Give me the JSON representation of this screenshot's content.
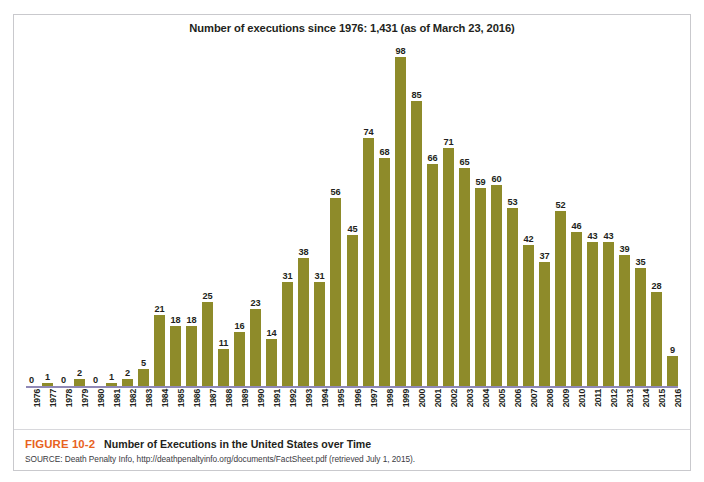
{
  "chart_data": {
    "type": "bar",
    "title": "Number of executions since 1976: 1,431 (as of March 23, 2016)",
    "xlabel": "",
    "ylabel": "",
    "ylim": [
      0,
      98
    ],
    "grid": false,
    "legend": "none",
    "bar_color": "#8E8B2A",
    "axis_color": "#8F88B6",
    "categories": [
      "1976",
      "1977",
      "1978",
      "1979",
      "1980",
      "1981",
      "1982",
      "1983",
      "1984",
      "1985",
      "1986",
      "1987",
      "1988",
      "1989",
      "1990",
      "1991",
      "1992",
      "1993",
      "1994",
      "1995",
      "1996",
      "1997",
      "1998",
      "1999",
      "2000",
      "2001",
      "2002",
      "2003",
      "2004",
      "2005",
      "2006",
      "2007",
      "2008",
      "2009",
      "2010",
      "2011",
      "2012",
      "2013",
      "2014",
      "2015",
      "2016"
    ],
    "values": [
      0,
      1,
      0,
      2,
      0,
      1,
      2,
      5,
      21,
      18,
      18,
      25,
      11,
      16,
      23,
      14,
      31,
      38,
      31,
      56,
      45,
      74,
      68,
      98,
      85,
      66,
      71,
      65,
      59,
      60,
      53,
      42,
      37,
      52,
      46,
      43,
      43,
      39,
      35,
      28,
      9
    ],
    "data_labels_shown": true
  },
  "figure": {
    "number": "FIGURE 10-2",
    "caption": "Number of Executions in the United States over Time",
    "source": "SOURCE: Death Penalty Info, http://deathpenaltyinfo.org/documents/FactSheet.pdf (retrieved July 1, 2015).",
    "number_color": "#E8621E"
  }
}
